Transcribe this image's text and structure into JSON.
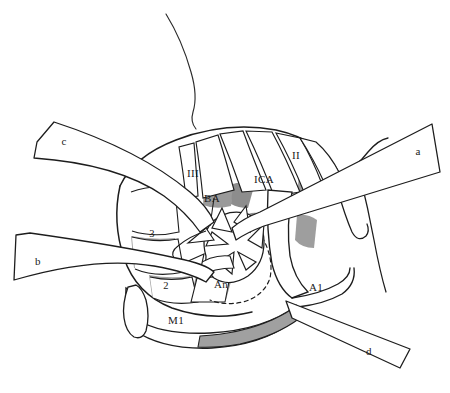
{
  "figure": {
    "type": "anatomical-line-drawing",
    "background_color": "#ffffff",
    "ink_color": "#1a1a1a",
    "shade_color": "#a0a0a0",
    "shade_color_dark": "#8f8f8f"
  },
  "labels": {
    "retractor_a": "a",
    "retractor_b": "b",
    "retractor_c": "c",
    "retractor_d": "d",
    "cranial_nerve_ii": "II",
    "cranial_nerve_iii": "III",
    "basilar_artery": "BA",
    "internal_carotid_artery": "ICA",
    "aneurysm": "An",
    "anterior_cerebral_a1": "A1",
    "middle_cerebral_m1": "M1",
    "segment_two": "2",
    "segment_three": "3"
  },
  "caption": {
    "text": ""
  }
}
